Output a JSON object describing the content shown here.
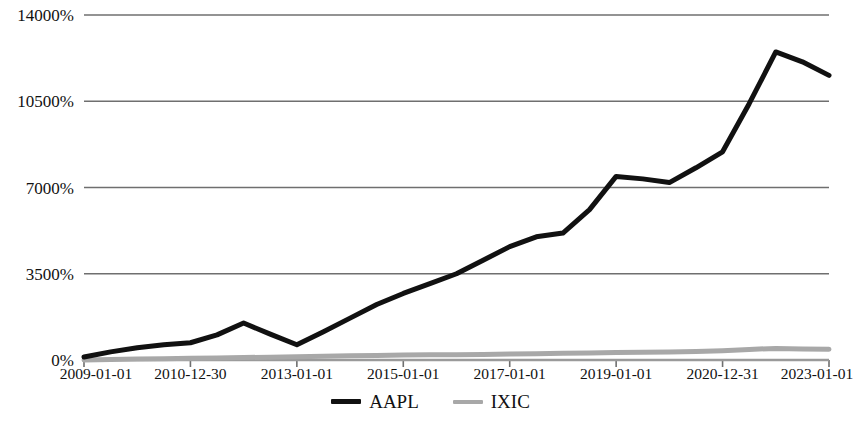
{
  "chart_data": {
    "type": "line",
    "title": "",
    "subtitle": "",
    "xlabel": "",
    "ylabel": "",
    "grid": true,
    "legend_position": "bottom-center",
    "ylim": [
      0,
      14000
    ],
    "y_ticks": [
      0,
      3500,
      7000,
      10500,
      14000
    ],
    "y_tick_labels": [
      "0%",
      "3500%",
      "7000%",
      "10500%",
      "14000%"
    ],
    "x_tick_labels": [
      "2009-01-01",
      "2010-12-30",
      "2013-01-01",
      "2015-01-01",
      "2017-01-01",
      "2019-01-01",
      "2020-12-31",
      "2023-01-01"
    ],
    "x": [
      "2009-01-01",
      "2009-07-01",
      "2010-01-01",
      "2010-07-01",
      "2010-12-30",
      "2011-07-01",
      "2012-01-01",
      "2012-07-01",
      "2013-01-01",
      "2013-07-01",
      "2014-01-01",
      "2014-07-01",
      "2015-01-01",
      "2015-07-01",
      "2016-01-01",
      "2016-07-01",
      "2017-01-01",
      "2017-07-01",
      "2018-01-01",
      "2018-07-01",
      "2019-01-01",
      "2019-07-01",
      "2020-01-01",
      "2020-07-01",
      "2020-12-31",
      "2021-07-01",
      "2022-01-01",
      "2022-07-01",
      "2023-01-01"
    ],
    "series": [
      {
        "name": "AAPL",
        "color": "#111111",
        "width": 5,
        "values": [
          120,
          330,
          500,
          620,
          700,
          1020,
          1500,
          1050,
          620,
          1150,
          1700,
          2250,
          2700,
          3100,
          3500,
          4050,
          4600,
          5000,
          5150,
          6100,
          7450,
          7350,
          7200,
          7800,
          8450,
          10400,
          12500,
          12100,
          11550
        ]
      },
      {
        "name": "IXIC",
        "color": "#a8a8a8",
        "width": 5,
        "values": [
          0,
          20,
          40,
          55,
          70,
          85,
          100,
          115,
          130,
          150,
          170,
          185,
          200,
          210,
          215,
          225,
          240,
          255,
          270,
          285,
          300,
          310,
          320,
          345,
          380,
          430,
          470,
          450,
          440
        ]
      }
    ],
    "legend": [
      {
        "label": "AAPL",
        "color": "#111111",
        "marker": "line-thick"
      },
      {
        "label": "IXIC",
        "color": "#a8a8a8",
        "marker": "line-thin"
      }
    ],
    "axis_colors": {
      "gridline": "#6f6f6f",
      "axis": "#9a9a9a",
      "tick": "#6f6f6f",
      "text": "#111111",
      "background": "#ffffff"
    },
    "plot_box": {
      "left": 84,
      "right": 829,
      "top": 15,
      "bottom": 360
    }
  }
}
